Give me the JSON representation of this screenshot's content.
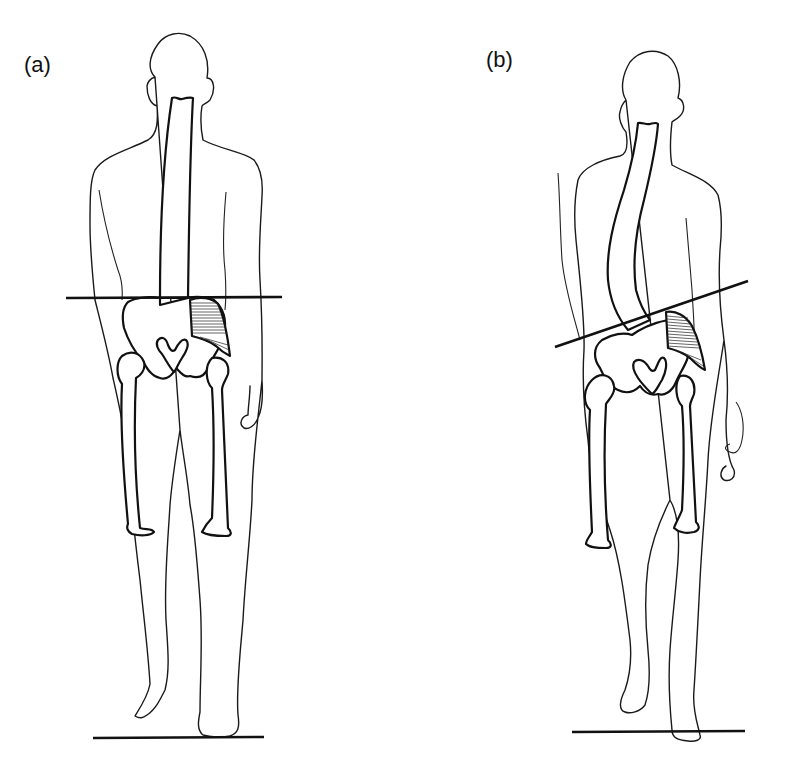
{
  "figure": {
    "panels": [
      {
        "label": "(a)",
        "pelvis_line": "level",
        "spine": "straight",
        "feet": "one foot lifted slightly, other on floor"
      },
      {
        "label": "(b)",
        "pelvis_line": "tilted",
        "spine": "laterally curved",
        "feet": "one foot lifted, other on floor"
      }
    ],
    "colors": {
      "line": "#111111",
      "background": "#ffffff"
    }
  }
}
